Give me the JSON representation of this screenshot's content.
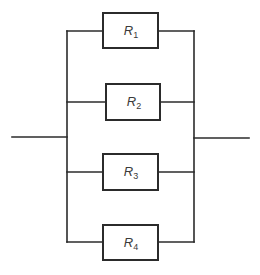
{
  "diagram": {
    "type": "parallel-resistor-circuit",
    "stroke_color": "#2b2b2b",
    "resistors": [
      {
        "symbol": "R",
        "index": "1",
        "box": {
          "x": 103,
          "y": 13,
          "w": 55,
          "h": 35
        }
      },
      {
        "symbol": "R",
        "index": "2",
        "box": {
          "x": 106,
          "y": 84,
          "w": 54,
          "h": 36
        }
      },
      {
        "symbol": "R",
        "index": "3",
        "box": {
          "x": 103,
          "y": 154,
          "w": 55,
          "h": 36
        }
      },
      {
        "symbol": "R",
        "index": "4",
        "box": {
          "x": 103,
          "y": 225,
          "w": 55,
          "h": 35
        }
      }
    ],
    "left_bus_x": 67,
    "right_bus_x": 194,
    "input_wire": {
      "x1": 12,
      "x2": 67,
      "y": 137
    },
    "output_wire": {
      "x1": 194,
      "x2": 249,
      "y": 138
    }
  }
}
